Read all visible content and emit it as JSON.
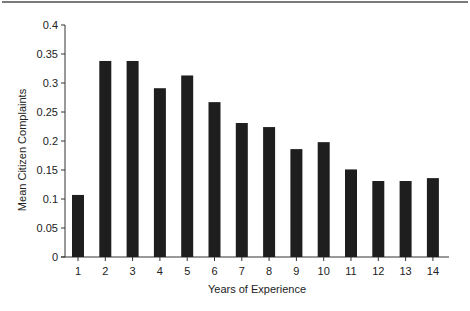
{
  "chart_data": {
    "type": "bar",
    "title": "",
    "xlabel": "Years of Experience",
    "ylabel": "Mean Citizen Complaints",
    "categories": [
      "1",
      "2",
      "3",
      "4",
      "5",
      "6",
      "7",
      "8",
      "9",
      "10",
      "11",
      "12",
      "13",
      "14"
    ],
    "values": [
      0.107,
      0.338,
      0.338,
      0.291,
      0.313,
      0.267,
      0.231,
      0.224,
      0.186,
      0.198,
      0.151,
      0.131,
      0.131,
      0.136
    ],
    "ylim": [
      0,
      0.4
    ],
    "yticks": [
      "0",
      "0.05",
      "0.1",
      "0.15",
      "0.2",
      "0.25",
      "0.3",
      "0.35",
      "0.4"
    ],
    "grid": false,
    "legend": null,
    "bar_color": "#1e1e1e"
  }
}
